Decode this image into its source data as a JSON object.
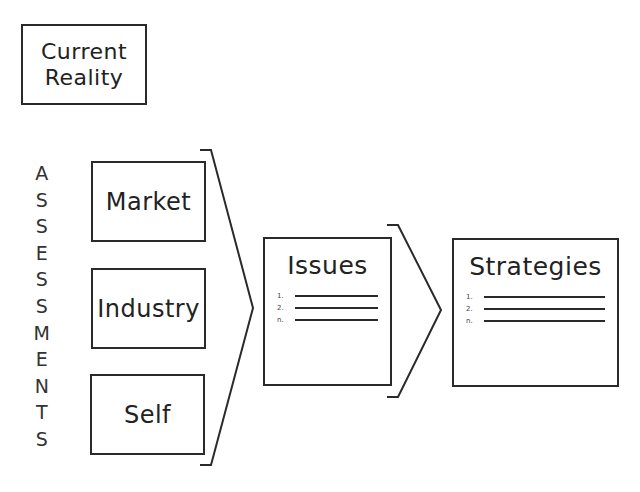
{
  "current_reality": {
    "line1": "Current",
    "line2": "Reality"
  },
  "assessments": {
    "vertical_label_letters": [
      "A",
      "S",
      "S",
      "E",
      "S",
      "S",
      "M",
      "E",
      "N",
      "T",
      "S"
    ],
    "boxes": [
      {
        "label": "Market"
      },
      {
        "label": "Industry"
      },
      {
        "label": "Self"
      }
    ]
  },
  "issues": {
    "title": "Issues",
    "items": [
      {
        "num": "1."
      },
      {
        "num": "2."
      },
      {
        "num": "n."
      }
    ]
  },
  "strategies": {
    "title": "Strategies",
    "items": [
      {
        "num": "1."
      },
      {
        "num": "2."
      },
      {
        "num": "n."
      }
    ]
  },
  "colors": {
    "stroke": "#2a2a2a",
    "background": "#ffffff"
  }
}
